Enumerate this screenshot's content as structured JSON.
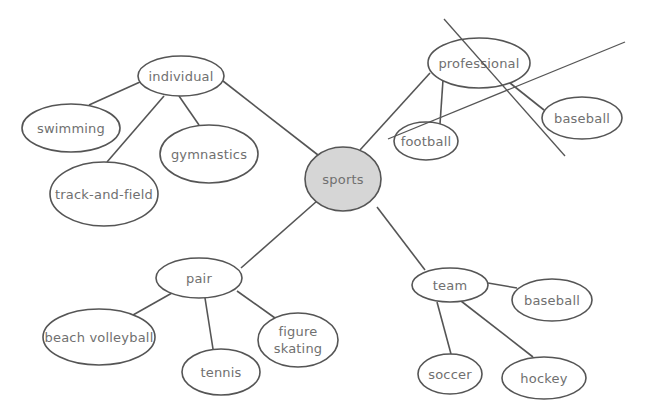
{
  "diagram": {
    "type": "concept-map",
    "colors": {
      "stroke": "#555555",
      "text": "#707070",
      "center_fill": "#d6d6d6",
      "node_fill": "#ffffff",
      "background": "#ffffff"
    },
    "center": {
      "id": "sports",
      "label": "sports",
      "cx": 343,
      "cy": 179,
      "rx": 38,
      "ry": 32
    },
    "nodes": [
      {
        "id": "individual",
        "label": "individual",
        "cx": 181,
        "cy": 76,
        "rx": 43,
        "ry": 20,
        "parent": "sports"
      },
      {
        "id": "swimming",
        "label": "swimming",
        "cx": 71,
        "cy": 128,
        "rx": 49,
        "ry": 24,
        "parent": "individual"
      },
      {
        "id": "track-and-field",
        "label": "track-and-field",
        "cx": 104,
        "cy": 194,
        "rx": 54,
        "ry": 32,
        "parent": "individual"
      },
      {
        "id": "gymnastics",
        "label": "gymnastics",
        "cx": 209,
        "cy": 154,
        "rx": 49,
        "ry": 29,
        "parent": "individual"
      },
      {
        "id": "professional",
        "label": "professional",
        "cx": 479,
        "cy": 63,
        "rx": 51,
        "ry": 25,
        "parent": "sports"
      },
      {
        "id": "football",
        "label": "football",
        "cx": 426,
        "cy": 141,
        "rx": 32,
        "ry": 19,
        "parent": "professional"
      },
      {
        "id": "baseball-pro",
        "label": "baseball",
        "cx": 582,
        "cy": 118,
        "rx": 40,
        "ry": 21,
        "parent": "professional"
      },
      {
        "id": "pair",
        "label": "pair",
        "cx": 199,
        "cy": 278,
        "rx": 43,
        "ry": 20,
        "parent": "sports"
      },
      {
        "id": "beach-volleyball",
        "label": "beach volleyball",
        "cx": 99,
        "cy": 337,
        "rx": 56,
        "ry": 28,
        "parent": "pair"
      },
      {
        "id": "tennis",
        "label": "tennis",
        "cx": 221,
        "cy": 372,
        "rx": 39,
        "ry": 23,
        "parent": "pair"
      },
      {
        "id": "figure-skating",
        "label_lines": [
          "figure",
          "skating"
        ],
        "cx": 298,
        "cy": 340,
        "rx": 40,
        "ry": 27,
        "parent": "pair"
      },
      {
        "id": "team",
        "label": "team",
        "cx": 450,
        "cy": 285,
        "rx": 38,
        "ry": 17,
        "parent": "sports"
      },
      {
        "id": "baseball-team",
        "label": "baseball",
        "cx": 552,
        "cy": 300,
        "rx": 40,
        "ry": 21,
        "parent": "team"
      },
      {
        "id": "soccer",
        "label": "soccer",
        "cx": 450,
        "cy": 374,
        "rx": 32,
        "ry": 20,
        "parent": "team"
      },
      {
        "id": "hockey",
        "label": "hockey",
        "cx": 544,
        "cy": 378,
        "rx": 42,
        "ry": 21,
        "parent": "team"
      }
    ],
    "edges": [
      {
        "from": "sports",
        "to": "individual",
        "x1": 318,
        "y1": 155,
        "x2": 223,
        "y2": 81
      },
      {
        "from": "individual",
        "to": "swimming",
        "x1": 140,
        "y1": 82,
        "x2": 89,
        "y2": 105
      },
      {
        "from": "individual",
        "to": "track-and-field",
        "x1": 164,
        "y1": 96,
        "x2": 107,
        "y2": 162
      },
      {
        "from": "individual",
        "to": "gymnastics",
        "x1": 179,
        "y1": 96,
        "x2": 199,
        "y2": 125
      },
      {
        "from": "sports",
        "to": "professional",
        "x1": 360,
        "y1": 150,
        "x2": 430,
        "y2": 73
      },
      {
        "from": "professional",
        "to": "football",
        "x1": 443,
        "y1": 80,
        "x2": 440,
        "y2": 124
      },
      {
        "from": "professional",
        "to": "baseball-pro",
        "x1": 510,
        "y1": 83,
        "x2": 544,
        "y2": 110
      },
      {
        "from": "sports",
        "to": "pair",
        "x1": 317,
        "y1": 201,
        "x2": 241,
        "y2": 268
      },
      {
        "from": "pair",
        "to": "beach-volleyball",
        "x1": 172,
        "y1": 293,
        "x2": 133,
        "y2": 315
      },
      {
        "from": "pair",
        "to": "tennis",
        "x1": 205,
        "y1": 298,
        "x2": 213,
        "y2": 349
      },
      {
        "from": "pair",
        "to": "figure-skating",
        "x1": 237,
        "y1": 291,
        "x2": 275,
        "y2": 318
      },
      {
        "from": "sports",
        "to": "team",
        "x1": 377,
        "y1": 207,
        "x2": 425,
        "y2": 270
      },
      {
        "from": "team",
        "to": "baseball-team",
        "x1": 488,
        "y1": 283,
        "x2": 517,
        "y2": 288
      },
      {
        "from": "team",
        "to": "soccer",
        "x1": 437,
        "y1": 302,
        "x2": 451,
        "y2": 354
      },
      {
        "from": "team",
        "to": "hockey",
        "x1": 461,
        "y1": 301,
        "x2": 533,
        "y2": 357
      }
    ],
    "cross_out_lines": [
      {
        "x1": 444,
        "y1": 19,
        "x2": 565,
        "y2": 156
      },
      {
        "x1": 388,
        "y1": 139,
        "x2": 625,
        "y2": 42
      }
    ]
  }
}
